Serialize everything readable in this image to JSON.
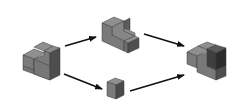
{
  "diagram": {
    "type": "block-composition-flow",
    "background": "#ffffff",
    "colors": {
      "top_face": "#8f8f8f",
      "front_face": "#7a7a7a",
      "side_face": "#4e4e4e",
      "highlight_top": "#5a5a5a",
      "highlight_front": "#3f3f3f",
      "highlight_side": "#2c2c2c",
      "edge": "#3a3a3a",
      "arrow": "#111111"
    },
    "nodes": [
      {
        "id": "start",
        "label": "L-shaped block (start)",
        "position": "left"
      },
      {
        "id": "upper",
        "label": "Stepped L-block (upper path)",
        "position": "top-center"
      },
      {
        "id": "lower",
        "label": "Single cube (lower path)",
        "position": "bottom-center"
      },
      {
        "id": "result",
        "label": "Combined block (result)",
        "position": "right"
      }
    ],
    "edges": [
      {
        "from": "start",
        "to": "upper"
      },
      {
        "from": "upper",
        "to": "result"
      },
      {
        "from": "start",
        "to": "lower"
      },
      {
        "from": "lower",
        "to": "result"
      }
    ]
  }
}
